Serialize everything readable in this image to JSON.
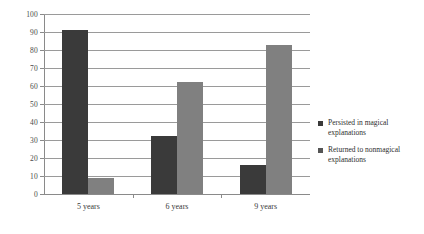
{
  "chart_data": {
    "type": "bar",
    "title": "",
    "subtitle": "",
    "xlabel": "",
    "ylabel": "",
    "categories": [
      "5 years",
      "6 years",
      "9 years"
    ],
    "series": [
      {
        "name": "Persisted in magical explanations",
        "color": "#3a3a3a",
        "values": [
          91,
          32,
          16
        ]
      },
      {
        "name": "Returned to nonmagical explanations",
        "color": "#808080",
        "values": [
          9,
          62,
          83
        ]
      }
    ],
    "ylim": [
      0,
      100
    ],
    "ytick_step": 10,
    "yticks": [
      0,
      10,
      20,
      30,
      40,
      50,
      60,
      70,
      80,
      90,
      100
    ],
    "ytick_labels": [
      "0",
      "10",
      "20",
      "30",
      "40",
      "50",
      "60",
      "70",
      "80",
      "90",
      "100"
    ],
    "grid": true,
    "grid_axis": "y",
    "legend_position": "right",
    "legend": [
      "Persisted in magical explanations",
      "Returned to nonmagical explanations"
    ],
    "background": "#ffffff",
    "grid_color": "#9a9a9a",
    "axis_color": "#8a8a8a"
  }
}
